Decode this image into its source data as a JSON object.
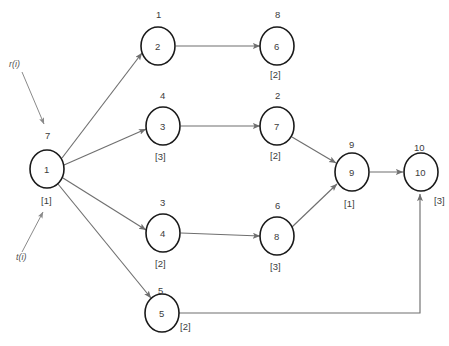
{
  "diagram": {
    "background_color": "#ffffff",
    "node_stroke_color": "#1a1a1a",
    "edge_color": "#6f6f6f",
    "text_color": "#3c3c3c",
    "annotations": [
      {
        "name": "r-label",
        "text": "r(i)"
      },
      {
        "name": "t-label",
        "text": "t(i)"
      }
    ],
    "nodes": [
      {
        "id": "1",
        "inner": "1",
        "above": "7",
        "below": "[1]",
        "cx": 47,
        "cy": 169
      },
      {
        "id": "2",
        "inner": "2",
        "above": "1",
        "below": "",
        "cx": 158,
        "cy": 46
      },
      {
        "id": "3",
        "inner": "3",
        "above": "4",
        "below": "[3]",
        "cx": 163,
        "cy": 126
      },
      {
        "id": "4",
        "inner": "4",
        "above": "3",
        "below": "[2]",
        "cx": 163,
        "cy": 233
      },
      {
        "id": "5",
        "inner": "5",
        "above": "5",
        "below": "",
        "cx": 162,
        "cy": 313
      },
      {
        "id": "6",
        "inner": "6",
        "above": "8",
        "below": "[2]",
        "cx": 277,
        "cy": 46
      },
      {
        "id": "7",
        "inner": "7",
        "above": "2",
        "below": "[2]",
        "cx": 277,
        "cy": 126
      },
      {
        "id": "8",
        "inner": "8",
        "above": "6",
        "below": "[3]",
        "cx": 277,
        "cy": 236
      },
      {
        "id": "9",
        "inner": "9",
        "above": "9",
        "below": "[1]",
        "cx": 352,
        "cy": 172
      },
      {
        "id": "10",
        "inner": "10",
        "above": "10",
        "below": "",
        "cx": 421,
        "cy": 172
      }
    ],
    "side_labels": [
      {
        "name": "node-5-bracket",
        "text": "[2]"
      },
      {
        "name": "node-10-bracket",
        "text": "[3]"
      }
    ],
    "edges": [
      {
        "from": "1",
        "to": "2"
      },
      {
        "from": "1",
        "to": "3"
      },
      {
        "from": "1",
        "to": "4"
      },
      {
        "from": "1",
        "to": "5"
      },
      {
        "from": "2",
        "to": "6"
      },
      {
        "from": "3",
        "to": "7"
      },
      {
        "from": "4",
        "to": "8"
      },
      {
        "from": "7",
        "to": "9"
      },
      {
        "from": "8",
        "to": "9"
      },
      {
        "from": "9",
        "to": "10"
      },
      {
        "from": "5",
        "to": "10"
      }
    ]
  }
}
